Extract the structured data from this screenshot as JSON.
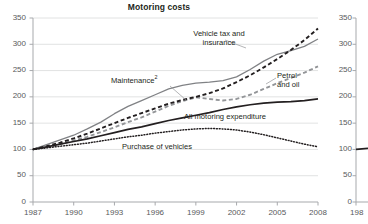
{
  "chart_data": {
    "type": "line",
    "title": "Motoring costs",
    "xlabel": "",
    "ylabel": "",
    "xlim": [
      1987,
      2008
    ],
    "ylim": [
      0,
      350
    ],
    "yticks": [
      0,
      50,
      100,
      150,
      200,
      250,
      300,
      350
    ],
    "xticks": [
      1987,
      1990,
      1993,
      1996,
      1999,
      2002,
      2005,
      2008
    ],
    "grid": true,
    "legend_position": "inline-annotations",
    "x": [
      1987,
      1988,
      1989,
      1990,
      1991,
      1992,
      1993,
      1994,
      1995,
      1996,
      1997,
      1998,
      1999,
      2000,
      2001,
      2002,
      2003,
      2004,
      2005,
      2006,
      2007,
      2008
    ],
    "series": [
      {
        "name": "Vehicle tax and insurance",
        "style": "solid",
        "color": "#808285",
        "values": [
          100,
          109,
          118,
          127,
          139,
          152,
          168,
          182,
          193,
          204,
          215,
          222,
          226,
          228,
          231,
          238,
          252,
          268,
          281,
          288,
          296,
          310
        ]
      },
      {
        "name": "Maintenance",
        "footnote": "2",
        "style": "dashed",
        "color": "#939598",
        "values": [
          100,
          104,
          110,
          117,
          124,
          133,
          142,
          152,
          161,
          172,
          183,
          192,
          199,
          196,
          193,
          196,
          204,
          215,
          226,
          236,
          246,
          258
        ]
      },
      {
        "name": "Petrol and oil",
        "style": "dashed",
        "color": "#231f20",
        "values": [
          100,
          106,
          113,
          121,
          130,
          140,
          150,
          160,
          169,
          178,
          187,
          194,
          200,
          207,
          216,
          228,
          241,
          256,
          272,
          289,
          308,
          330
        ]
      },
      {
        "name": "All motoring expenditure",
        "style": "solid",
        "color": "#231f20",
        "values": [
          100,
          105,
          110,
          115,
          120,
          126,
          132,
          138,
          143,
          149,
          155,
          160,
          165,
          170,
          176,
          181,
          185,
          188,
          190,
          191,
          193,
          196
        ]
      },
      {
        "name": "Purchase of vehicles",
        "style": "dotted",
        "color": "#231f20",
        "values": [
          100,
          103,
          106,
          109,
          112,
          116,
          120,
          124,
          127,
          131,
          134,
          137,
          139,
          140,
          139,
          137,
          133,
          128,
          122,
          116,
          110,
          105
        ]
      }
    ]
  },
  "labels": {
    "vehicle_tax": "Vehicle tax and\ninsurance",
    "maintenance": "Maintenance",
    "maintenance_footnote": "2",
    "petrol": "Petrol\nand oil",
    "all_motoring": "All motoring expenditure",
    "purchase": "Purchase of vehicles"
  },
  "right_chart": {
    "yticks": [
      "350",
      "300",
      "250",
      "200",
      "150",
      "100",
      "50",
      "0"
    ],
    "xtick": "198"
  }
}
